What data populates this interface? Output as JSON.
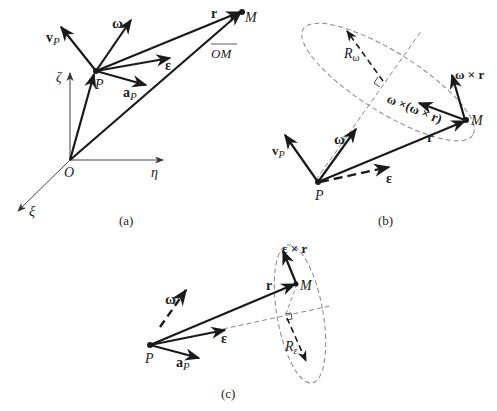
{
  "figure": {
    "colors": {
      "ink": "#1a1a1a",
      "thin": "#444444",
      "dash": "#888888"
    },
    "panels": [
      {
        "id": "a",
        "caption": "(a)",
        "labels": {
          "vP_v": "v",
          "vP_sub": "P",
          "omega": "ω",
          "r": "r",
          "M": "M",
          "OM": "OM",
          "eps": "ε",
          "P": "P",
          "aP_a": "a",
          "aP_sub": "P",
          "zeta": "ζ",
          "O": "O",
          "eta": "η",
          "xi": "ξ"
        }
      },
      {
        "id": "b",
        "caption": "(b)",
        "labels": {
          "R": "R",
          "R_sub": "ω",
          "omega_x_r": "ω × r",
          "omega_x_omega_x_r": "ω ×(ω × r)",
          "M": "M",
          "r": "r",
          "omega": "ω",
          "vP_v": "v",
          "vP_sub": "P",
          "eps": "ε",
          "P": "P"
        }
      },
      {
        "id": "c",
        "caption": "(c)",
        "labels": {
          "eps_x_r": "ε × r",
          "r": "r",
          "M": "M",
          "omega": "ω",
          "eps": "ε",
          "P": "P",
          "aP_a": "a",
          "aP_sub": "P",
          "R": "R",
          "R_sub": "ε"
        }
      }
    ]
  }
}
